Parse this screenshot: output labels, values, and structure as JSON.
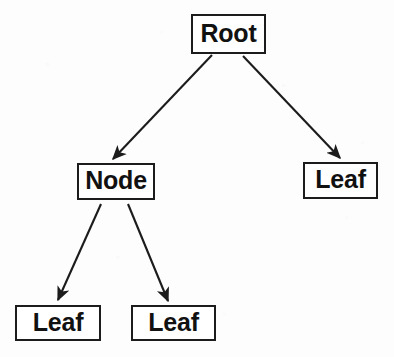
{
  "diagram": {
    "type": "tree",
    "background_color": "#fdfdfd",
    "stroke_color": "#1c1c1c",
    "text_color": "#111111",
    "nodes": [
      {
        "id": "root",
        "label": "Root",
        "x": 191,
        "y": 14,
        "w": 75,
        "h": 40
      },
      {
        "id": "node",
        "label": "Node",
        "x": 77,
        "y": 163,
        "w": 78,
        "h": 37
      },
      {
        "id": "leaf-right",
        "label": "Leaf",
        "x": 303,
        "y": 162,
        "w": 75,
        "h": 37
      },
      {
        "id": "leaf-bottom-left",
        "label": "Leaf",
        "x": 15,
        "y": 305,
        "w": 86,
        "h": 36
      },
      {
        "id": "leaf-bottom-middle",
        "label": "Leaf",
        "x": 131,
        "y": 305,
        "w": 85,
        "h": 36
      }
    ],
    "edges": [
      {
        "id": "root-to-node",
        "from": "root",
        "to": "node",
        "x1": 212,
        "y1": 55,
        "x2": 113,
        "y2": 159,
        "arrow": true
      },
      {
        "id": "root-to-leaf-right",
        "from": "root",
        "to": "leaf-right",
        "x1": 243,
        "y1": 56,
        "x2": 340,
        "y2": 158,
        "arrow": true
      },
      {
        "id": "node-to-leaf-left",
        "from": "node",
        "to": "leaf-bottom-left",
        "x1": 101,
        "y1": 204,
        "x2": 58,
        "y2": 300,
        "arrow": true
      },
      {
        "id": "node-to-leaf-middle",
        "from": "node",
        "to": "leaf-bottom-middle",
        "x1": 128,
        "y1": 204,
        "x2": 168,
        "y2": 301,
        "arrow": true
      }
    ]
  }
}
